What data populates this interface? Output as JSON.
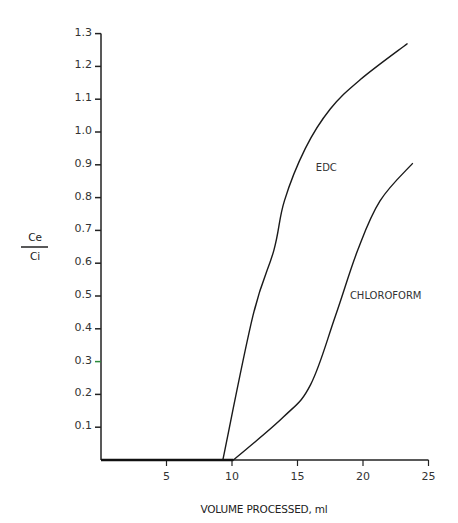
{
  "chart_data": {
    "type": "line",
    "title": "",
    "xlabel": "VOLUME PROCESSED, ml",
    "ylabel_numerator": "Ce",
    "ylabel_denominator": "Ci",
    "xlim": [
      0,
      25
    ],
    "ylim": [
      0,
      1.3
    ],
    "x_ticks": [
      5,
      10,
      15,
      20,
      25
    ],
    "x_tick_labels": [
      "5",
      "10",
      "15",
      "20",
      "25"
    ],
    "y_ticks": [
      0.1,
      0.2,
      0.3,
      0.4,
      0.5,
      0.6,
      0.7,
      0.8,
      0.9,
      1.0,
      1.1,
      1.2,
      1.3
    ],
    "y_tick_labels": [
      "0.1",
      "0.2",
      "0.3",
      "0.4",
      "0.5",
      "0.6",
      "0.7",
      "0.8",
      "0.9",
      "1.0",
      "1.1",
      "1.2",
      "1.3"
    ],
    "grid": false,
    "legend": "inline labels",
    "series": [
      {
        "name": "EDC",
        "x": [
          0,
          9.3,
          11.6,
          13.2,
          14.0,
          15.6,
          17.5,
          19.8,
          23.4
        ],
        "values": [
          0,
          0,
          0.44,
          0.64,
          0.79,
          0.95,
          1.07,
          1.16,
          1.27
        ],
        "label_at": [
          16.4,
          0.88
        ]
      },
      {
        "name": "CHLOROFORM",
        "x": [
          0,
          10.1,
          13.9,
          16.0,
          17.9,
          19.6,
          21.3,
          23.8
        ],
        "values": [
          0,
          0,
          0.13,
          0.23,
          0.44,
          0.64,
          0.79,
          0.905
        ],
        "label_at": [
          19.0,
          0.49
        ]
      }
    ]
  }
}
